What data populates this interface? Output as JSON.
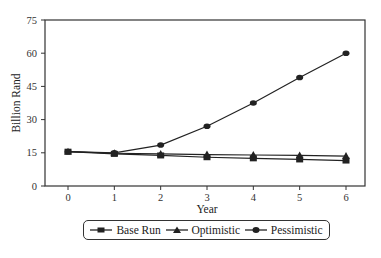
{
  "chart_data": {
    "type": "line",
    "title": "",
    "xlabel": "Year",
    "ylabel": "Billion Rand",
    "x": [
      0,
      1,
      2,
      3,
      4,
      5,
      6
    ],
    "xticks": [
      "0",
      "1",
      "2",
      "3",
      "4",
      "5",
      "6"
    ],
    "yticks": [
      "0",
      "15",
      "30",
      "45",
      "60",
      "75"
    ],
    "ylim": [
      0,
      75
    ],
    "grid": false,
    "legend_position": "bottom",
    "series": [
      {
        "name": "Base Run",
        "marker": "square",
        "values": [
          15.5,
          14.5,
          13.8,
          13.0,
          12.5,
          12.0,
          11.5
        ]
      },
      {
        "name": "Optimistic",
        "marker": "triangle",
        "values": [
          15.5,
          14.8,
          14.5,
          14.2,
          14.0,
          13.8,
          13.5
        ]
      },
      {
        "name": "Pessimistic",
        "marker": "circle",
        "values": [
          15.5,
          15.0,
          18.5,
          27.0,
          37.5,
          49.0,
          60.0
        ]
      }
    ]
  },
  "legend": {
    "items": [
      {
        "label": "Base Run"
      },
      {
        "label": "Optimistic"
      },
      {
        "label": "Pessimistic"
      }
    ]
  }
}
